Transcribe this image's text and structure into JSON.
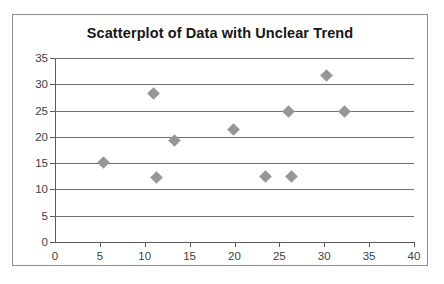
{
  "chart_data": {
    "type": "scatter",
    "title": "Scatterplot of Data with Unclear Trend",
    "xlabel": "",
    "ylabel": "",
    "xlim": [
      0,
      40
    ],
    "ylim": [
      0,
      35
    ],
    "xticks": [
      0,
      5,
      10,
      15,
      20,
      25,
      30,
      35,
      40
    ],
    "yticks": [
      0,
      5,
      10,
      15,
      20,
      25,
      30,
      35
    ],
    "grid": "horizontal",
    "legend": "none",
    "marker": "diamond",
    "marker_color": "#969696",
    "series": [
      {
        "name": "Data",
        "points": [
          {
            "x": 5.4,
            "y": 15.2
          },
          {
            "x": 11.0,
            "y": 28.3
          },
          {
            "x": 11.3,
            "y": 12.3
          },
          {
            "x": 13.3,
            "y": 19.4
          },
          {
            "x": 19.9,
            "y": 21.4
          },
          {
            "x": 23.4,
            "y": 12.4
          },
          {
            "x": 26.3,
            "y": 12.5
          },
          {
            "x": 26.0,
            "y": 24.8
          },
          {
            "x": 30.2,
            "y": 31.6
          },
          {
            "x": 32.3,
            "y": 24.8
          }
        ]
      }
    ]
  }
}
